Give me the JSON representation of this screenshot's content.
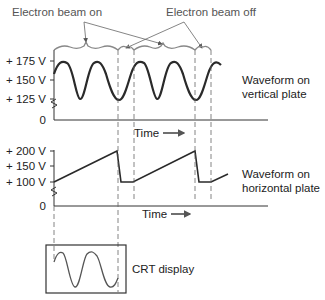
{
  "callouts": {
    "beam_on": "Electron beam on",
    "beam_off": "Electron beam off"
  },
  "vertical_plot": {
    "y_ticks": [
      "+ 175 V",
      "+ 150 V",
      "+ 125 V",
      "0"
    ],
    "x_label": "Time",
    "caption_line1": "Waveform on",
    "caption_line2": "vertical plate"
  },
  "horizontal_plot": {
    "y_ticks": [
      "+ 200 V",
      "+ 150 V",
      "+ 100 V",
      "0"
    ],
    "x_label": "Time",
    "caption_line1": "Waveform on",
    "caption_line2": "horizontal plate"
  },
  "crt": {
    "label": "CRT display"
  },
  "colors": {
    "waveform": "#2a2a2a",
    "axis": "#333333",
    "dashed": "#666666",
    "bracket": "#777777"
  }
}
